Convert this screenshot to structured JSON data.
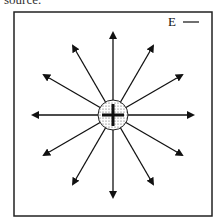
{
  "top_text_fragment": "source.",
  "legend": {
    "label": "E"
  },
  "diagram": {
    "charge_sign": "+",
    "field_line_count": 12,
    "field_line_angles_deg": [
      0,
      30,
      60,
      90,
      120,
      150,
      180,
      210,
      240,
      270,
      300,
      330
    ]
  }
}
